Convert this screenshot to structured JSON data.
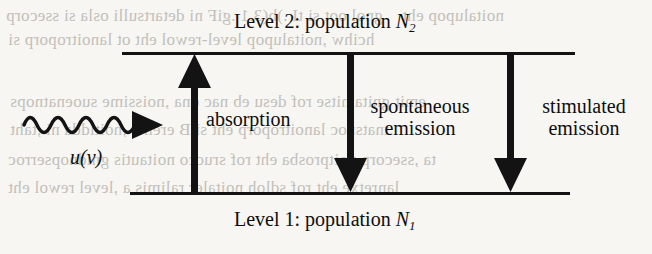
{
  "figure": {
    "type": "two-level atomic energy diagram",
    "background_color": "#f7f6f3",
    "ink_color": "#131313",
    "bleed_color": "#b9b6b0"
  },
  "levels": {
    "upper": {
      "label_prefix": "Level 2: population ",
      "symbol": "N",
      "subscript": "2"
    },
    "lower": {
      "label_prefix": "Level 1: population ",
      "symbol": "N",
      "subscript": "1"
    }
  },
  "radiation": {
    "icon": "wavy-photon-arrow",
    "label_u": "u",
    "label_open": "(",
    "label_nu": "ν",
    "label_close": ")"
  },
  "processes": {
    "absorption": {
      "label": "absorption",
      "direction": "up",
      "icon": "up-arrow-icon"
    },
    "spontaneous": {
      "line1": "spontaneous",
      "line2": "emission",
      "direction": "down",
      "icon": "down-arrow-icon"
    },
    "stimulated": {
      "line1": "stimulated",
      "line2": "emission",
      "direction": "down",
      "icon": "down-arrow-icon"
    }
  },
  "bleed_text": {
    "row1_left": "gnol oot si tI .)b(3.1 .giF ni detartsulli osla si ssecorp",
    "row1_right": "noitalupop eht",
    "row2_left": "hcihw ,noitalupop level-rewol eht ot lanoitroporp si",
    "row3_left": "emit gnitamitse rof desu eb nac dna ,noissime suoenatnops",
    "row4_left": "tnatsnoc lanoitroporp eht si B erehw ,noitidda ni ,taht",
    "row5_left": "ta ,ssecorp noitprosba eht rof srucco noitautis gnidnopserroc",
    "row6_left": "lanretxe eht rof sdloh noitaler ralimis a ,level rewol eht"
  }
}
